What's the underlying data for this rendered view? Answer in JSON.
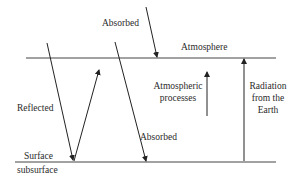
{
  "diagram": {
    "labels": {
      "absorbed_top": "Absorbed",
      "atmosphere": "Atmosphere",
      "reflected": "Reflected",
      "atmospheric_processes_line1": "Atmospheric",
      "atmospheric_processes_line2": "processes",
      "radiation_line1": "Radiation",
      "radiation_line2": "from the",
      "radiation_line3": "Earth",
      "absorbed_bottom": "Absorbed",
      "surface": "Surface",
      "subsurface": "subsurface"
    },
    "colors": {
      "line": "#333333",
      "text": "#2a2a2a",
      "background": "#ffffff"
    }
  }
}
